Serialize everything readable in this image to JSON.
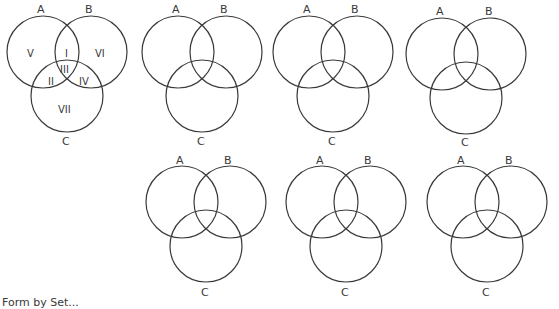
{
  "diagram": {
    "type": "venn-3-set-worksheet",
    "set_labels": {
      "a": "A",
      "b": "B",
      "c": "C"
    },
    "region_labels": [
      "I",
      "II",
      "III",
      "IV",
      "V",
      "VI",
      "VII"
    ],
    "diagrams": [
      {
        "id": 1,
        "row": 1,
        "labeled_regions": true
      },
      {
        "id": 2,
        "row": 1,
        "labeled_regions": false
      },
      {
        "id": 3,
        "row": 1,
        "labeled_regions": false
      },
      {
        "id": 4,
        "row": 1,
        "labeled_regions": false
      },
      {
        "id": 5,
        "row": 2,
        "labeled_regions": false
      },
      {
        "id": 6,
        "row": 2,
        "labeled_regions": false
      },
      {
        "id": 7,
        "row": 2,
        "labeled_regions": false
      }
    ],
    "region_descriptions": {
      "I": "A ∩ B only",
      "II": "A ∩ C only",
      "III": "A ∩ B ∩ C",
      "IV": "B ∩ C only",
      "V": "A only",
      "VI": "B only",
      "VII": "C only"
    }
  },
  "caption": {
    "text": "Form by Set..."
  },
  "colors": {
    "stroke": "#3a3a3a",
    "background": "#ffffff"
  }
}
